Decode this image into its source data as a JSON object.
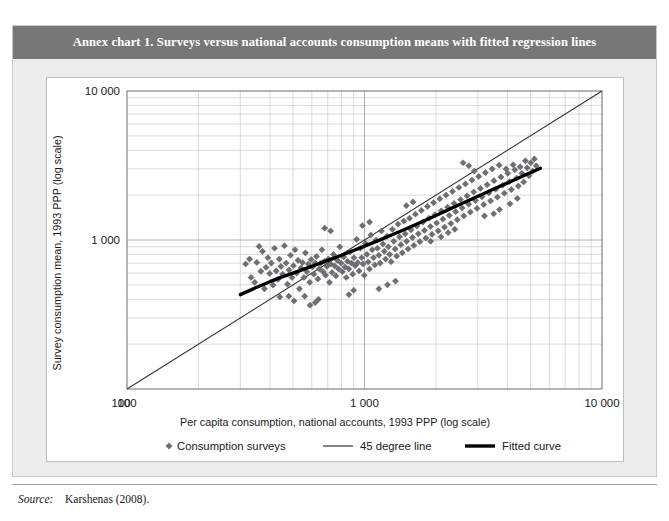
{
  "figure": {
    "title": "Annex chart 1. Surveys versus national accounts consumption means with fitted regression lines",
    "source_label": "Source:",
    "source_value": "Karshenas (2008).",
    "banner_color": "#777777",
    "panel_background": "#ffffff",
    "frame_background": "#ececed"
  },
  "chart_data": {
    "type": "scatter",
    "title": "Annex chart 1. Surveys versus national accounts consumption means with fitted regression lines",
    "xlabel": "Per capita consumption, national accounts, 1993 PPP (log scale)",
    "ylabel": "Survey consumption mean, 1993 PPP (log scale)",
    "xscale": "log",
    "yscale": "log",
    "xlim": [
      100,
      10000
    ],
    "ylim": [
      100,
      10000
    ],
    "xticks": [
      100,
      1000,
      10000
    ],
    "xticklabels": [
      "100",
      "1 000",
      "10 000"
    ],
    "yticks": [
      100,
      1000,
      10000
    ],
    "yticklabels": [
      "100",
      "1 000",
      "10 000"
    ],
    "grid": true,
    "grid_minor": true,
    "grid_color": "#c8c8d2",
    "legend_position": "below-axes",
    "marker_color": "#6e6e75",
    "marker_shape": "diamond",
    "series": [
      {
        "name": "Consumption surveys",
        "type": "scatter",
        "points": [
          [
            316,
            690
          ],
          [
            328,
            745
          ],
          [
            333,
            560
          ],
          [
            345,
            520
          ],
          [
            352,
            707
          ],
          [
            360,
            905
          ],
          [
            366,
            616
          ],
          [
            372,
            840
          ],
          [
            379,
            470
          ],
          [
            385,
            655
          ],
          [
            392,
            760
          ],
          [
            399,
            596
          ],
          [
            405,
            700
          ],
          [
            412,
            498
          ],
          [
            418,
            880
          ],
          [
            425,
            620
          ],
          [
            432,
            545
          ],
          [
            438,
            745
          ],
          [
            445,
            665
          ],
          [
            452,
            590
          ],
          [
            460,
            915
          ],
          [
            468,
            700
          ],
          [
            474,
            505
          ],
          [
            481,
            628
          ],
          [
            488,
            790
          ],
          [
            495,
            560
          ],
          [
            502,
            672
          ],
          [
            510,
            860
          ],
          [
            518,
            600
          ],
          [
            525,
            730
          ],
          [
            532,
            470
          ],
          [
            540,
            648
          ],
          [
            548,
            705
          ],
          [
            556,
            560
          ],
          [
            564,
            820
          ],
          [
            572,
            612
          ],
          [
            580,
            690
          ],
          [
            588,
            520
          ],
          [
            596,
            740
          ],
          [
            604,
            660
          ],
          [
            612,
            590
          ],
          [
            620,
            700
          ],
          [
            628,
            775
          ],
          [
            636,
            548
          ],
          [
            645,
            640
          ],
          [
            654,
            700
          ],
          [
            662,
            860
          ],
          [
            670,
            612
          ],
          [
            678,
            720
          ],
          [
            686,
            580
          ],
          [
            695,
            665
          ],
          [
            704,
            745
          ],
          [
            712,
            520
          ],
          [
            721,
            690
          ],
          [
            730,
            605
          ],
          [
            740,
            800
          ],
          [
            749,
            670
          ],
          [
            758,
            575
          ],
          [
            768,
            730
          ],
          [
            777,
            640
          ],
          [
            787,
            900
          ],
          [
            797,
            700
          ],
          [
            807,
            612
          ],
          [
            817,
            770
          ],
          [
            827,
            660
          ],
          [
            838,
            560
          ],
          [
            848,
            720
          ],
          [
            859,
            640
          ],
          [
            870,
            835
          ],
          [
            881,
            700
          ],
          [
            892,
            590
          ],
          [
            903,
            760
          ],
          [
            914,
            672
          ],
          [
            926,
            1010
          ],
          [
            937,
            705
          ],
          [
            949,
            620
          ],
          [
            961,
            880
          ],
          [
            973,
            760
          ],
          [
            986,
            690
          ],
          [
            998,
            580
          ],
          [
            1011,
            950
          ],
          [
            1024,
            800
          ],
          [
            1037,
            712
          ],
          [
            1050,
            640
          ],
          [
            1064,
            1080
          ],
          [
            1077,
            860
          ],
          [
            1091,
            760
          ],
          [
            1105,
            680
          ],
          [
            1120,
            1000
          ],
          [
            1134,
            880
          ],
          [
            1149,
            790
          ],
          [
            1164,
            700
          ],
          [
            1179,
            1150
          ],
          [
            1195,
            940
          ],
          [
            1211,
            840
          ],
          [
            1227,
            745
          ],
          [
            1243,
            1060
          ],
          [
            1260,
            900
          ],
          [
            1277,
            800
          ],
          [
            1294,
            715
          ],
          [
            1311,
            1180
          ],
          [
            1329,
            980
          ],
          [
            1347,
            870
          ],
          [
            1366,
            780
          ],
          [
            1385,
            1280
          ],
          [
            1404,
            1050
          ],
          [
            1423,
            930
          ],
          [
            1443,
            820
          ],
          [
            1463,
            1340
          ],
          [
            1484,
            1100
          ],
          [
            1505,
            980
          ],
          [
            1526,
            870
          ],
          [
            1548,
            1400
          ],
          [
            1570,
            1170
          ],
          [
            1592,
            1040
          ],
          [
            1615,
            920
          ],
          [
            1638,
            1490
          ],
          [
            1662,
            1240
          ],
          [
            1686,
            1100
          ],
          [
            1711,
            975
          ],
          [
            1736,
            1580
          ],
          [
            1761,
            1320
          ],
          [
            1787,
            1160
          ],
          [
            1813,
            1030
          ],
          [
            1840,
            1680
          ],
          [
            1868,
            1400
          ],
          [
            1896,
            1230
          ],
          [
            1924,
            1090
          ],
          [
            1953,
            1780
          ],
          [
            1983,
            1480
          ],
          [
            2013,
            1300
          ],
          [
            2043,
            1150
          ],
          [
            2075,
            1890
          ],
          [
            2106,
            1570
          ],
          [
            2139,
            1380
          ],
          [
            2172,
            1220
          ],
          [
            2205,
            2000
          ],
          [
            2239,
            1660
          ],
          [
            2274,
            1460
          ],
          [
            2310,
            1290
          ],
          [
            2346,
            2120
          ],
          [
            2383,
            1760
          ],
          [
            2420,
            1550
          ],
          [
            2458,
            1370
          ],
          [
            2497,
            2250
          ],
          [
            2537,
            1870
          ],
          [
            2577,
            1640
          ],
          [
            2618,
            1450
          ],
          [
            2660,
            2380
          ],
          [
            2703,
            1980
          ],
          [
            2746,
            1740
          ],
          [
            2791,
            1540
          ],
          [
            2836,
            2520
          ],
          [
            2882,
            2100
          ],
          [
            2929,
            1840
          ],
          [
            2977,
            1630
          ],
          [
            3026,
            2670
          ],
          [
            3075,
            2220
          ],
          [
            3126,
            1950
          ],
          [
            3178,
            1730
          ],
          [
            3230,
            2830
          ],
          [
            3284,
            2350
          ],
          [
            3339,
            2070
          ],
          [
            3394,
            1830
          ],
          [
            3451,
            3000
          ],
          [
            3509,
            2500
          ],
          [
            3568,
            2190
          ],
          [
            3628,
            1940
          ],
          [
            3689,
            3180
          ],
          [
            3752,
            2650
          ],
          [
            3815,
            2330
          ],
          [
            3880,
            2060
          ],
          [
            3946,
            3000
          ],
          [
            4013,
            2800
          ],
          [
            4082,
            2470
          ],
          [
            4151,
            2180
          ],
          [
            4223,
            3200
          ],
          [
            4295,
            2960
          ],
          [
            4369,
            2600
          ],
          [
            4444,
            2300
          ],
          [
            4521,
            3100
          ],
          [
            4599,
            2800
          ],
          [
            4679,
            2450
          ],
          [
            4760,
            3400
          ],
          [
            4843,
            3050
          ],
          [
            4928,
            2700
          ],
          [
            5014,
            3300
          ],
          [
            5102,
            2900
          ],
          [
            5192,
            3500
          ],
          [
            5283,
            3150
          ],
          [
            2600,
            3300
          ],
          [
            2750,
            3150
          ],
          [
            2900,
            2900
          ],
          [
            1500,
            1700
          ],
          [
            1600,
            1800
          ],
          [
            680,
            1200
          ],
          [
            720,
            1150
          ],
          [
            980,
            1250
          ],
          [
            1050,
            1320
          ],
          [
            860,
            430
          ],
          [
            900,
            460
          ],
          [
            1150,
            470
          ],
          [
            1250,
            500
          ],
          [
            1350,
            530
          ],
          [
            620,
            380
          ],
          [
            640,
            400
          ],
          [
            560,
            420
          ],
          [
            590,
            365
          ],
          [
            480,
            420
          ],
          [
            505,
            390
          ],
          [
            440,
            415
          ],
          [
            2100,
            1050
          ],
          [
            2250,
            1120
          ],
          [
            2400,
            1180
          ],
          [
            1900,
            980
          ],
          [
            3500,
            1500
          ],
          [
            3700,
            1600
          ],
          [
            3200,
            1450
          ],
          [
            4100,
            1750
          ],
          [
            4400,
            1900
          ]
        ]
      },
      {
        "name": "45 degree line",
        "type": "line",
        "style": "thin",
        "color": "#333333",
        "points": [
          [
            100,
            100
          ],
          [
            10000,
            10000
          ]
        ]
      },
      {
        "name": "Fitted curve",
        "type": "line",
        "style": "thick",
        "color": "#000000",
        "points": [
          [
            300,
            430
          ],
          [
            350,
            480
          ],
          [
            400,
            525
          ],
          [
            450,
            565
          ],
          [
            500,
            600
          ],
          [
            560,
            640
          ],
          [
            630,
            685
          ],
          [
            700,
            730
          ],
          [
            800,
            790
          ],
          [
            900,
            850
          ],
          [
            1000,
            910
          ],
          [
            1150,
            995
          ],
          [
            1300,
            1080
          ],
          [
            1500,
            1190
          ],
          [
            1700,
            1300
          ],
          [
            2000,
            1460
          ],
          [
            2300,
            1620
          ],
          [
            2700,
            1820
          ],
          [
            3100,
            2010
          ],
          [
            3600,
            2240
          ],
          [
            4200,
            2500
          ],
          [
            4800,
            2750
          ],
          [
            5300,
            2950
          ],
          [
            5500,
            3030
          ]
        ]
      }
    ]
  },
  "legend": {
    "items": [
      {
        "label": "Consumption surveys",
        "marker": "diamond-marker",
        "color": "#6e6e75"
      },
      {
        "label": "45 degree line",
        "marker": "thin-line",
        "color": "#333333"
      },
      {
        "label": "Fitted curve",
        "marker": "thick-line",
        "color": "#000000"
      }
    ]
  }
}
